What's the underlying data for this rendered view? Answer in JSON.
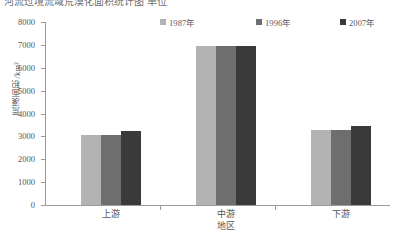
{
  "top_cropped_text": "河流过境流域荒漠化面积统计图 单位",
  "chart_data": {
    "type": "bar",
    "title": "",
    "xlabel": "地区",
    "ylabel": "荒漠面积/km²",
    "categories": [
      "上游",
      "中游",
      "下游"
    ],
    "series": [
      {
        "name": "1987年",
        "color": "#b3b3b3",
        "values": [
          3050,
          6950,
          3300
        ]
      },
      {
        "name": "1996年",
        "color": "#6e6e6e",
        "values": [
          3050,
          6950,
          3300
        ]
      },
      {
        "name": "2007年",
        "color": "#3a3a3a",
        "values": [
          3250,
          6950,
          3450
        ]
      }
    ],
    "ylim": [
      0,
      8000
    ],
    "yticks": [
      0,
      1000,
      2000,
      3000,
      4000,
      5000,
      6000,
      7000,
      8000
    ],
    "ytick_labels": [
      "0",
      "1000",
      "2000",
      "3000",
      "4000",
      "5000",
      "6000",
      "7000",
      "8000"
    ],
    "grid": false,
    "legend_position": "top"
  },
  "legend": {
    "items": [
      {
        "label": "1987年",
        "color": "#b3b3b3"
      },
      {
        "label": "1996年",
        "color": "#6e6e6e"
      },
      {
        "label": "2007年",
        "color": "#3a3a3a"
      }
    ]
  },
  "axes": {
    "y_title": "荒漠面积/km²",
    "x_title": "地区"
  }
}
